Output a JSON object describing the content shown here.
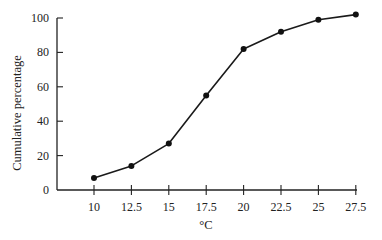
{
  "chart_data": {
    "type": "line",
    "title": "",
    "xlabel": "°C",
    "ylabel": "Cumulative percentage",
    "categories": [
      "10",
      "12.5",
      "15",
      "17.5",
      "20",
      "22.5",
      "25",
      "27.5"
    ],
    "x": [
      10,
      12.5,
      15,
      17.5,
      20,
      22.5,
      25,
      27.5
    ],
    "values": [
      7,
      14,
      27,
      55,
      82,
      92,
      99,
      102
    ],
    "series": [
      {
        "name": "Cumulative percentage",
        "values": [
          7,
          14,
          27,
          55,
          82,
          92,
          99,
          102
        ]
      }
    ],
    "yticks": [
      0,
      20,
      40,
      60,
      80,
      100
    ],
    "ylim": [
      0,
      100
    ],
    "xlim": [
      7.5,
      27.5
    ],
    "grid": false,
    "legend": null,
    "markers": "filled-circle",
    "line_color": "#1a1a1a"
  }
}
